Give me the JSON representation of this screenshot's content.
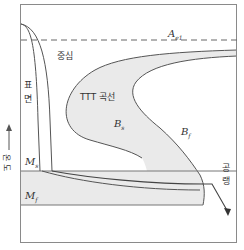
{
  "diagram": {
    "type": "TTT / continuous cooling transformation schematic",
    "labels": {
      "ae1": "A",
      "ae1_sub": "e1",
      "center": "중심",
      "surface_1": "표",
      "surface_2": "면",
      "ttt_curve": "TTT 곡선",
      "bs": "B",
      "bs_sub": "s",
      "bf": "B",
      "bf_sub": "f",
      "ms": "M",
      "ms_sub": "s",
      "mf": "M",
      "mf_sub": "f",
      "air_cooling_1": "공",
      "air_cooling_2": "랭",
      "y_axis_1": "온",
      "y_axis_2": "도"
    },
    "uncertain_readings": {
      "y_axis": "Left rotated label rendered as 온도 (temperature); glyphs were only partly legible at 3x zoom and this reading is inferred, not confirmed",
      "curve_interpretation": "Surface/center cooling curves and TTT regions are identified from diagram conventions, not from explicit text in the image"
    },
    "colors": {
      "frame": "#8a8a8a",
      "line": "#555555",
      "shade": "#eaeaea",
      "text": "#333333"
    }
  }
}
